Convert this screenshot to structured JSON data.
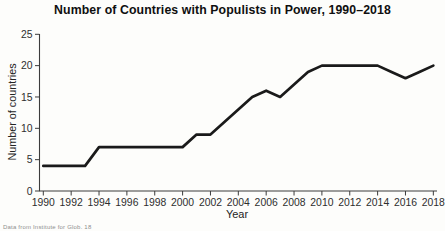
{
  "chart": {
    "source_note": "Data from Institute for Glob. 18"
  },
  "chart_data": {
    "type": "line",
    "title": "Number of Countries with Populists in Power, 1990–2018",
    "xlabel": "Year",
    "ylabel": "Number of countries",
    "x": [
      1990,
      1991,
      1992,
      1993,
      1994,
      1995,
      1996,
      1997,
      1998,
      1999,
      2000,
      2001,
      2002,
      2003,
      2004,
      2005,
      2006,
      2007,
      2008,
      2009,
      2010,
      2011,
      2012,
      2013,
      2014,
      2015,
      2016,
      2017,
      2018
    ],
    "values": [
      4,
      4,
      4,
      4,
      7,
      7,
      7,
      7,
      7,
      7,
      7,
      9,
      9,
      11,
      13,
      15,
      16,
      15,
      17,
      19,
      20,
      20,
      20,
      20,
      20,
      19,
      18,
      19,
      20
    ],
    "series_name": "Countries with populists in power",
    "xticks": [
      1990,
      1992,
      1994,
      1996,
      1998,
      2000,
      2002,
      2004,
      2006,
      2008,
      2010,
      2012,
      2014,
      2016,
      2018
    ],
    "yticks": [
      0,
      5,
      10,
      15,
      20,
      25
    ],
    "xlim": [
      1990,
      2018
    ],
    "ylim": [
      0,
      25
    ],
    "grid": false,
    "legend": "none",
    "line_color": "#1a1a1a",
    "axis_color": "#3c3c3c"
  }
}
